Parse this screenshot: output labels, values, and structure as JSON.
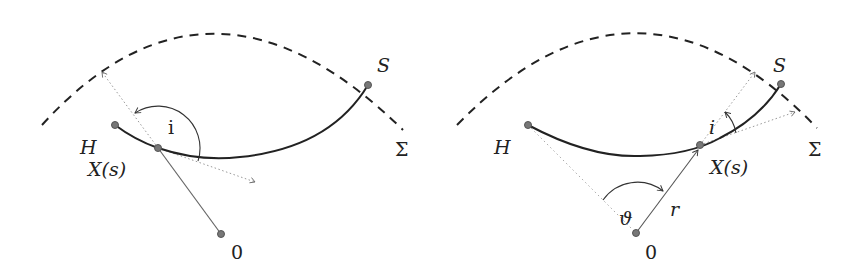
{
  "panels": [
    {
      "id": "left",
      "labels": {
        "S": "S",
        "Sigma": "Σ",
        "H": "H",
        "X": "X(s)",
        "origin": "0",
        "angle_i": "i"
      }
    },
    {
      "id": "right",
      "labels": {
        "S": "S",
        "Sigma": "Σ",
        "H": "H",
        "X": "X(s)",
        "origin": "0",
        "angle_theta": "ϑ",
        "radius": "r",
        "angle_i": "i"
      }
    }
  ],
  "colors": {
    "curve": "#222222",
    "dashed": "#222222",
    "dotted": "#888888",
    "point": "#777777"
  }
}
